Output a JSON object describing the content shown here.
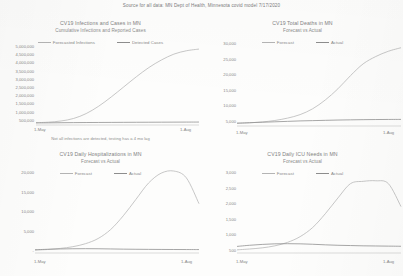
{
  "document": {
    "source_note": "Source for all data: MN Dept of Health, Minnesota covid model 7/17/2020",
    "ink_color": "#8a8a8a",
    "paper_color": "#fdfdfc",
    "forecast_color": "#b9b9b9",
    "actual_color": "#909090"
  },
  "panels": [
    {
      "id": "infections-and-cases",
      "title": "CV19 Infections and Cases in MN",
      "subtitle": "Cumulative Infections and Reported Cases",
      "legend": [
        "Forecasted Infections",
        "Detected Cases"
      ],
      "footnote": "Not all infections are detected, testing has a 4 mo lag",
      "yticks": [
        "5,000,000",
        "4,500,000",
        "4,000,000",
        "3,500,000",
        "3,000,000",
        "2,500,000",
        "2,000,000",
        "1,500,000",
        "1,000,000",
        "500,000"
      ],
      "xticks": [
        "1-May",
        "1-Aug"
      ]
    },
    {
      "id": "total-deaths",
      "title": "CV19 Total Deaths in MN",
      "subtitle": "Forecast vs Actual",
      "legend": [
        "Forecast",
        "Actual"
      ],
      "footnote": "",
      "yticks": [
        "30,000",
        "25,000",
        "20,000",
        "15,000",
        "10,000",
        "5,000"
      ],
      "xticks": [
        "1-May",
        "1-Aug"
      ]
    },
    {
      "id": "daily-hospitalizations",
      "title": "CV19 Daily Hospitalizations in MN",
      "subtitle": "Forecast vs Actual",
      "legend": [
        "Forecast",
        "Actual"
      ],
      "footnote": "",
      "yticks": [
        "20,000",
        "15,000",
        "10,000",
        "5,000",
        "-"
      ],
      "xticks": [
        "1-May",
        "1-Aug"
      ]
    },
    {
      "id": "daily-icu-needs",
      "title": "CV19 Daily ICU Needs in MN",
      "subtitle": "Forecast vs Actual",
      "legend": [
        "Forecast",
        "Actual"
      ],
      "footnote": "",
      "yticks": [
        "3,000",
        "2,500",
        "2,000",
        "1,500",
        "1,000",
        "500"
      ],
      "xticks": [
        "1-May",
        "1-Aug"
      ]
    }
  ],
  "chart_data": [
    {
      "type": "line",
      "title": "CV19 Infections and Cases in MN",
      "subtitle": "Cumulative Infections and Reported Cases",
      "xlabel": "",
      "ylabel": "",
      "grid": false,
      "legend_position": "top-center",
      "annotation": "Not all infections are detected, testing has a 4 mo lag",
      "x": [
        "1-May",
        "8-May",
        "15-May",
        "22-May",
        "29-May",
        "5-Jun",
        "12-Jun",
        "19-Jun",
        "26-Jun",
        "3-Jul",
        "10-Jul",
        "17-Jul",
        "24-Jul",
        "1-Aug"
      ],
      "ylim": [
        0,
        5000000
      ],
      "yticks": [
        500000,
        1000000,
        1500000,
        2000000,
        2500000,
        3000000,
        3500000,
        4000000,
        4500000,
        5000000
      ],
      "series": [
        {
          "name": "Forecasted Infections",
          "values": [
            20000,
            50000,
            120000,
            270000,
            560000,
            1000000,
            1550000,
            2150000,
            2750000,
            3300000,
            3750000,
            4100000,
            4300000,
            4400000
          ]
        },
        {
          "name": "Detected Cases",
          "values": [
            5000,
            11000,
            17000,
            23000,
            28000,
            32000,
            36000,
            40000,
            43000,
            46000,
            49000,
            52000,
            54000,
            56000
          ]
        }
      ]
    },
    {
      "type": "line",
      "title": "CV19 Total Deaths in MN",
      "subtitle": "Forecast vs Actual",
      "xlabel": "",
      "ylabel": "",
      "grid": false,
      "legend_position": "top-center",
      "x": [
        "1-May",
        "8-May",
        "15-May",
        "22-May",
        "29-May",
        "5-Jun",
        "12-Jun",
        "19-Jun",
        "26-Jun",
        "3-Jul",
        "10-Jul",
        "17-Jul",
        "24-Jul",
        "1-Aug"
      ],
      "ylim": [
        0,
        30000
      ],
      "yticks": [
        5000,
        10000,
        15000,
        20000,
        25000,
        30000
      ],
      "series": [
        {
          "name": "Forecast",
          "values": [
            200,
            400,
            700,
            1200,
            2000,
            3200,
            5200,
            8200,
            12000,
            16500,
            20500,
            23000,
            24800,
            26000
          ]
        },
        {
          "name": "Actual",
          "values": [
            300,
            450,
            600,
            750,
            900,
            1050,
            1150,
            1250,
            1350,
            1420,
            1480,
            1520,
            1550,
            1570
          ]
        }
      ]
    },
    {
      "type": "line",
      "title": "CV19 Daily Hospitalizations in MN",
      "subtitle": "Forecast vs Actual",
      "xlabel": "",
      "ylabel": "",
      "grid": false,
      "legend_position": "top-center",
      "x": [
        "1-May",
        "8-May",
        "15-May",
        "22-May",
        "29-May",
        "5-Jun",
        "12-Jun",
        "19-Jun",
        "26-Jun",
        "3-Jul",
        "10-Jul",
        "17-Jul",
        "24-Jul",
        "1-Aug"
      ],
      "ylim": [
        0,
        20000
      ],
      "yticks": [
        0,
        5000,
        10000,
        15000,
        20000
      ],
      "series": [
        {
          "name": "Forecast",
          "values": [
            200,
            350,
            600,
            1000,
            1700,
            2900,
            5000,
            8200,
            12000,
            15800,
            18100,
            18600,
            17000,
            11000
          ]
        },
        {
          "name": "Actual",
          "values": [
            300,
            400,
            480,
            520,
            540,
            520,
            480,
            430,
            400,
            380,
            360,
            350,
            340,
            330
          ]
        }
      ]
    },
    {
      "type": "line",
      "title": "CV19 Daily ICU Needs in MN",
      "subtitle": "Forecast vs Actual",
      "xlabel": "",
      "ylabel": "",
      "grid": false,
      "legend_position": "top-center",
      "x": [
        "1-May",
        "8-May",
        "15-May",
        "22-May",
        "29-May",
        "5-Jun",
        "12-Jun",
        "19-Jun",
        "26-Jun",
        "3-Jul",
        "10-Jul",
        "17-Jul",
        "24-Jul",
        "1-Aug"
      ],
      "ylim": [
        0,
        3000
      ],
      "yticks": [
        500,
        1000,
        1500,
        2000,
        2500,
        3000
      ],
      "series": [
        {
          "name": "Forecast",
          "values": [
            40,
            70,
            110,
            180,
            300,
            500,
            820,
            1300,
            1850,
            2350,
            2430,
            2450,
            2350,
            1550
          ]
        },
        {
          "name": "Actual",
          "values": [
            160,
            200,
            230,
            250,
            255,
            250,
            235,
            215,
            200,
            190,
            180,
            175,
            170,
            165
          ]
        }
      ]
    }
  ]
}
